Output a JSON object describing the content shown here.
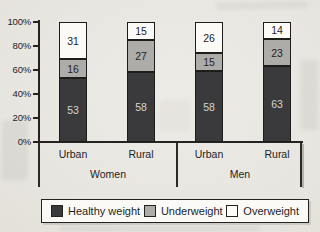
{
  "chart_data": {
    "type": "bar",
    "stacked": true,
    "percent": true,
    "title": "",
    "xlabel": "",
    "ylabel": "",
    "ylim": [
      0,
      100
    ],
    "grid": false,
    "y_ticks_top_to_bottom": [
      "100%",
      "80%",
      "60%",
      "40%",
      "20%",
      "0%"
    ],
    "categories": [
      "Urban",
      "Rural",
      "Urban",
      "Rural"
    ],
    "groups": [
      {
        "label": "Women",
        "categories": [
          "Urban",
          "Rural"
        ]
      },
      {
        "label": "Men",
        "categories": [
          "Urban",
          "Rural"
        ]
      }
    ],
    "series": [
      {
        "name": "Healthy weight",
        "color": "#3a3a3c",
        "label_color": "#d4d4d1",
        "values": [
          53,
          58,
          58,
          63
        ]
      },
      {
        "name": "Underweight",
        "color": "#aeaca8",
        "label_color": "#1f1f1f",
        "values": [
          16,
          27,
          15,
          23
        ]
      },
      {
        "name": "Overweight",
        "color": "#fbfaf6",
        "label_color": "#1f1f1f",
        "values": [
          31,
          15,
          26,
          14
        ]
      }
    ],
    "legend": {
      "position": "bottom",
      "entries": [
        "Healthy weight",
        "Underweight",
        "Overweight"
      ]
    }
  },
  "colors": {
    "paper": "#e9e7e1",
    "axis": "#23231f",
    "legend_background": "#fbfaf6"
  }
}
